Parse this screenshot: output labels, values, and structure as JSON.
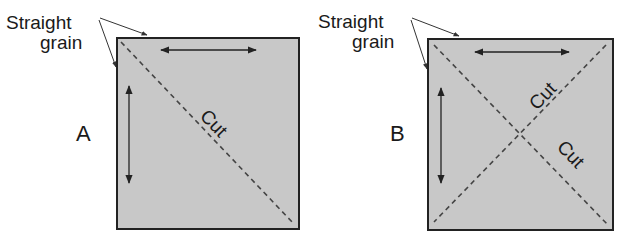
{
  "colors": {
    "fabric": "#c8c8c8",
    "border": "#222222",
    "text": "#1a1a1a",
    "cut_line": "#444444"
  },
  "panels": [
    {
      "id": "A",
      "label": "A",
      "annotation": {
        "line1": "Straight",
        "line2": "grain"
      },
      "cut_labels": [
        "Cut"
      ],
      "cuts": [
        "diagonal top-left to bottom-right"
      ],
      "grain_arrows": [
        "horizontal",
        "vertical"
      ]
    },
    {
      "id": "B",
      "label": "B",
      "annotation": {
        "line1": "Straight",
        "line2": "grain"
      },
      "cut_labels": [
        "Cut",
        "Cut"
      ],
      "cuts": [
        "diagonal top-left to bottom-right",
        "diagonal top-right to bottom-left"
      ],
      "grain_arrows": [
        "horizontal",
        "vertical"
      ]
    }
  ]
}
